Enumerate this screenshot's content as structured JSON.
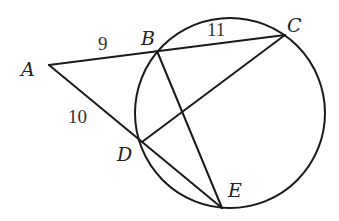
{
  "diagram": {
    "colors": {
      "stroke": "#1a1a1a",
      "text": "#222222",
      "background": "#ffffff"
    },
    "circle": {
      "cx": 230,
      "cy": 113,
      "r": 95
    },
    "points": {
      "A": {
        "label": "A",
        "x": 49,
        "y": 65
      },
      "B": {
        "label": "B",
        "x": 157,
        "y": 51
      },
      "C": {
        "label": "C",
        "x": 285,
        "y": 35
      },
      "D": {
        "label": "D",
        "x": 142,
        "y": 142
      },
      "E": {
        "label": "E",
        "x": 222,
        "y": 208
      }
    },
    "segments": [
      {
        "from": "A",
        "to": "C"
      },
      {
        "from": "A",
        "to": "E"
      },
      {
        "from": "B",
        "to": "E"
      },
      {
        "from": "D",
        "to": "C"
      }
    ],
    "lengths": {
      "AB": "9",
      "BC": "11",
      "AD": "10"
    }
  }
}
